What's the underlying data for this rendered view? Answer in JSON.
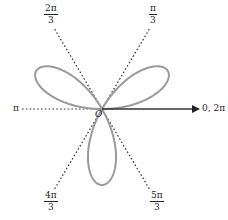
{
  "chart_data": {
    "type": "line",
    "subtype": "polar",
    "title": "",
    "curve": {
      "equation": "r = sin(3θ)",
      "petals": 3,
      "petal_directions_deg": [
        30,
        150,
        270
      ],
      "color": "#9a9a9a"
    },
    "rays": [
      {
        "angle_deg": 0,
        "label": "0, 2π",
        "style": "solid-arrow"
      },
      {
        "angle_deg": 60,
        "label_num": "π",
        "label_den": "3",
        "style": "dotted"
      },
      {
        "angle_deg": 120,
        "label_num": "2π",
        "label_den": "3",
        "style": "dotted"
      },
      {
        "angle_deg": 180,
        "label": "π",
        "style": "dotted"
      },
      {
        "angle_deg": 240,
        "label_num": "4π",
        "label_den": "3",
        "style": "dotted"
      },
      {
        "angle_deg": 300,
        "label_num": "5π",
        "label_den": "3",
        "style": "dotted"
      }
    ],
    "origin_label": "O",
    "grid": false,
    "legend": null
  },
  "labels": {
    "zero": "0, 2π",
    "pi": "π",
    "pi3_num": "π",
    "pi3_den": "3",
    "twopi3_num": "2π",
    "twopi3_den": "3",
    "fourpi3_num": "4π",
    "fourpi3_den": "3",
    "fivepi3_num": "5π",
    "fivepi3_den": "3",
    "origin": "O"
  }
}
